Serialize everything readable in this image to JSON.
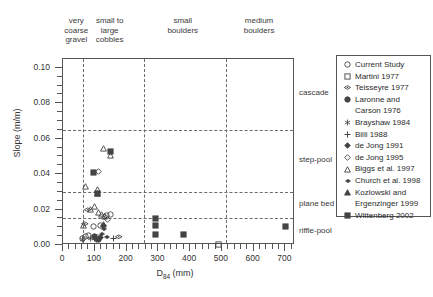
{
  "chart_data": {
    "type": "scatter",
    "title": "",
    "xlabel": "D84 (mm)",
    "xlabel_base": "D",
    "xlabel_sub": "84",
    "xlabel_unit": " (mm)",
    "ylabel": "Slope (m/m)",
    "xlim": [
      0,
      730
    ],
    "ylim": [
      0,
      0.105
    ],
    "xticks": [
      0,
      100,
      200,
      300,
      400,
      500,
      600,
      700
    ],
    "yticks": [
      0.0,
      0.02,
      0.04,
      0.06,
      0.08,
      0.1
    ],
    "ytick_labels": [
      "0.00",
      "0.02",
      "0.04",
      "0.06",
      "0.08",
      "0.10"
    ],
    "grid": false,
    "legend_position": "right-outside",
    "grain_size_categories": [
      {
        "label": "very\ncoarse\ngravel",
        "x_center": 45
      },
      {
        "label": "small to\nlarge\ncobbles",
        "x_center": 150
      },
      {
        "label": "small\nboulders",
        "x_center": 380
      },
      {
        "label": "medium\nboulders",
        "x_center": 620
      }
    ],
    "grain_size_boundaries": [
      64,
      256,
      512
    ],
    "channel_regimes": [
      {
        "label": "cascade",
        "slope_min": 0.065,
        "slope_max": 0.105
      },
      {
        "label": "step-pool",
        "slope_min": 0.03,
        "slope_max": 0.065
      },
      {
        "label": "plane bed",
        "slope_min": 0.015,
        "slope_max": 0.03
      },
      {
        "label": "riffle-pool",
        "slope_min": 0.0,
        "slope_max": 0.015
      }
    ],
    "regime_boundaries": [
      0.065,
      0.03,
      0.015
    ],
    "series": [
      {
        "name": "Current Study",
        "marker": "open-circle",
        "points": [
          [
            150,
            0.0212
          ],
          [
            95,
            0.0145
          ],
          [
            80,
            0.0095
          ],
          [
            60,
            0.0078
          ],
          [
            138,
            0.0205
          ],
          [
            118,
            0.0152
          ],
          [
            72,
            0.0088
          ],
          [
            108,
            0.0082
          ]
        ]
      },
      {
        "name": "Martini 1977",
        "marker": "open-square",
        "points": [
          [
            490,
            0.0045
          ]
        ]
      },
      {
        "name": "Teisseyre 1977",
        "marker": "horizontal-diamond",
        "points": [
          [
            78,
            0.0238
          ],
          [
            70,
            0.0158
          ],
          [
            175,
            0.0082
          ]
        ]
      },
      {
        "name": "Laronne and Carson 1976",
        "marker": "filled-circle",
        "points": [
          [
            100,
            0.0085
          ],
          [
            112,
            0.0072
          ]
        ]
      },
      {
        "name": "Brayshaw 1984",
        "marker": "asterisk",
        "points": [
          [
            62,
            0.0068
          ],
          [
            85,
            0.0078
          ],
          [
            98,
            0.0075
          ]
        ]
      },
      {
        "name": "Billi 1988",
        "marker": "plus",
        "points": [
          [
            158,
            0.0078
          ]
        ]
      },
      {
        "name": "de Jong 1991",
        "marker": "filled-diamond",
        "points": [
          [
            128,
            0.0148
          ],
          [
            118,
            0.0082
          ],
          [
            105,
            0.007
          ]
        ]
      },
      {
        "name": "de Jong 1995",
        "marker": "open-diamond",
        "points": [
          [
            112,
            0.0452
          ],
          [
            130,
            0.0198
          ],
          [
            140,
            0.0182
          ]
        ]
      },
      {
        "name": "Biggs et al. 1997",
        "marker": "open-triangle",
        "points": [
          [
            128,
            0.0582
          ],
          [
            148,
            0.0545
          ],
          [
            72,
            0.0368
          ],
          [
            108,
            0.0352
          ],
          [
            98,
            0.0258
          ],
          [
            88,
            0.0238
          ],
          [
            112,
            0.0225
          ],
          [
            120,
            0.0212
          ],
          [
            132,
            0.0198
          ],
          [
            64,
            0.0152
          ],
          [
            128,
            0.0158
          ]
        ]
      },
      {
        "name": "Church et al. 1998",
        "marker": "small-filled-diamond",
        "points": [
          [
            130,
            0.0135
          ],
          [
            122,
            0.0105
          ],
          [
            140,
            0.0092
          ]
        ]
      },
      {
        "name": "Kozlowski and Ergenzinger 1999",
        "marker": "filled-triangle",
        "points": [
          [
            110,
            0.0328
          ]
        ]
      },
      {
        "name": "Wittenberg 2002",
        "marker": "filled-square",
        "points": [
          [
            148,
            0.0565
          ],
          [
            95,
            0.0448
          ],
          [
            108,
            0.0332
          ],
          [
            290,
            0.0188
          ],
          [
            290,
            0.0148
          ],
          [
            290,
            0.0098
          ],
          [
            380,
            0.0098
          ],
          [
            700,
            0.0145
          ]
        ]
      }
    ]
  },
  "legend": {
    "entries": [
      {
        "marker": "open-circle",
        "label": "Current Study"
      },
      {
        "marker": "open-square",
        "label": "Martini 1977"
      },
      {
        "marker": "horizontal-diamond",
        "label": "Teisseyre 1977"
      },
      {
        "marker": "filled-circle",
        "label": "Laronne and",
        "label2": "Carson 1976"
      },
      {
        "marker": "asterisk",
        "label": "Brayshaw 1984"
      },
      {
        "marker": "plus",
        "label": "Billi 1988"
      },
      {
        "marker": "filled-diamond",
        "label": "de Jong 1991"
      },
      {
        "marker": "open-diamond",
        "label": "de Jong 1995"
      },
      {
        "marker": "open-triangle",
        "label": "Biggs et al. 1997"
      },
      {
        "marker": "small-filled-diamond",
        "label": "Church et al. 1998"
      },
      {
        "marker": "filled-triangle",
        "label": "Kozlowski and",
        "label2": "Ergenzinger 1999"
      },
      {
        "marker": "filled-square",
        "label": "Wittenberg 2002"
      }
    ]
  },
  "colors": {
    "marker": "#444444",
    "axis": "#555555",
    "dashed": "#6b6b6b",
    "text": "#333333"
  }
}
